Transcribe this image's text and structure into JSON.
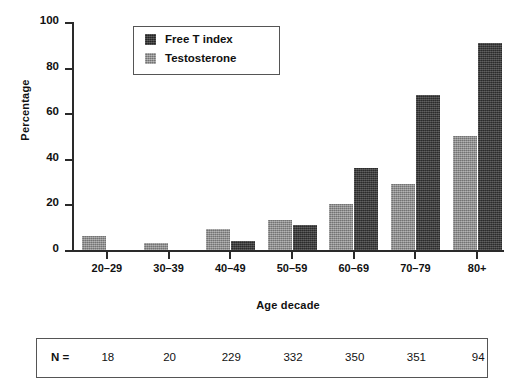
{
  "chart_data": {
    "type": "bar",
    "title": "",
    "xlabel": "Age decade",
    "ylabel": "Percentage",
    "categories": [
      "20–29",
      "30–39",
      "40–49",
      "50–59",
      "60–69",
      "70–79",
      "80+"
    ],
    "series": [
      {
        "name": "Free T index",
        "color": "#3b3b3b",
        "values": [
          0,
          0,
          4,
          11,
          36,
          68,
          91
        ]
      },
      {
        "name": "Testosterone",
        "color": "#8b8b8b",
        "values": [
          6,
          3,
          9,
          13,
          20,
          29,
          50
        ]
      }
    ],
    "ylim": [
      0,
      100
    ],
    "yticks": [
      0,
      20,
      40,
      60,
      80,
      100
    ],
    "ytick_labels": [
      "0",
      "20",
      "40",
      "60",
      "80",
      "100"
    ],
    "grid": false,
    "legend_position": "upper-left-inside",
    "bar_order": [
      "Testosterone",
      "Free T index"
    ]
  },
  "legend": {
    "entries": [
      {
        "label": "Free T index",
        "swatch": "dark"
      },
      {
        "label": "Testosterone",
        "swatch": "light"
      }
    ]
  },
  "n_table": {
    "label": "N =",
    "values": [
      "18",
      "20",
      "229",
      "332",
      "350",
      "351",
      "94"
    ]
  },
  "colors": {
    "free_t_index": "#3b3b3b",
    "testosterone": "#8b8b8b",
    "axis": "#2a2a2a",
    "border": "#555555",
    "text": "#111111",
    "background": "#ffffff"
  }
}
